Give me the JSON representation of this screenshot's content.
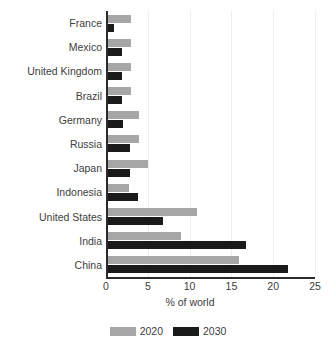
{
  "chart_data": {
    "type": "bar",
    "orientation": "horizontal",
    "title": "",
    "xlabel": "% of world",
    "ylabel": "",
    "xlim": [
      0,
      25
    ],
    "xticks": [
      0,
      5,
      10,
      15,
      20,
      25
    ],
    "xtick_labels": [
      "0",
      "5",
      "10",
      "15",
      "20",
      "25"
    ],
    "grid": true,
    "grid_axis": "x",
    "legend_position": "bottom",
    "categories": [
      "France",
      "Mexico",
      "United Kingdom",
      "Brazil",
      "Germany",
      "Russia",
      "Japan",
      "Indonesia",
      "United States",
      "India",
      "China"
    ],
    "series": [
      {
        "name": "2020",
        "color": "#a6a6a6",
        "values": [
          3.0,
          3.0,
          3.0,
          3.0,
          4.0,
          4.0,
          5.0,
          2.8,
          10.9,
          9.0,
          15.9
        ]
      },
      {
        "name": "2030",
        "color": "#1a1a1a",
        "values": [
          0.9,
          1.9,
          1.9,
          1.9,
          2.0,
          2.9,
          2.9,
          3.8,
          6.8,
          16.8,
          21.8
        ]
      }
    ]
  },
  "legend": {
    "items": [
      {
        "label": "2020",
        "color": "#a6a6a6"
      },
      {
        "label": "2030",
        "color": "#1a1a1a"
      }
    ]
  }
}
